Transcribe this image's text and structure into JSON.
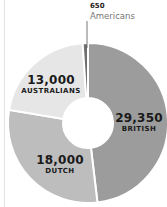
{
  "chart_data": {
    "type": "pie",
    "variant": "donut",
    "categories": [
      "British",
      "Dutch",
      "Australians",
      "Americans"
    ],
    "values": [
      29350,
      18000,
      13000,
      650
    ],
    "labels": [
      {
        "value": "29,350",
        "name": "BRITISH"
      },
      {
        "value": "18,000",
        "name": "DUTCH"
      },
      {
        "value": "13,000",
        "name": "AUSTRALIANS"
      },
      {
        "value": "650",
        "name": "Americans"
      }
    ],
    "colors": [
      "#9c9c9c",
      "#bdbdbd",
      "#e6e6e6",
      "#6e6e6e"
    ],
    "title": "",
    "legend": "none"
  }
}
